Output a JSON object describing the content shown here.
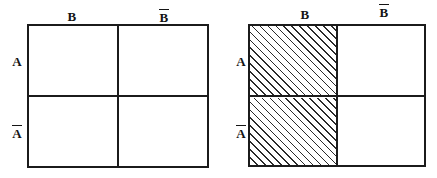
{
  "figure": {
    "background_color": "#ffffff",
    "line_color": "#1b1b1b",
    "hatch_color": "#2a2a2a"
  },
  "diagrams": [
    {
      "id": "left",
      "name": "diagram-a",
      "meaning": "A",
      "column_labels": [
        {
          "text": "B",
          "overbar": false
        },
        {
          "text": "B",
          "overbar": true
        }
      ],
      "row_labels": [
        {
          "text": "A",
          "overbar": false
        },
        {
          "text": "A",
          "overbar": true
        }
      ],
      "cells": [
        {
          "row": "A",
          "col": "B",
          "shaded": true
        },
        {
          "row": "A",
          "col": "Bbar",
          "shaded": true
        },
        {
          "row": "Abar",
          "col": "B",
          "shaded": false
        },
        {
          "row": "Abar",
          "col": "Bbar",
          "shaded": false
        }
      ],
      "shaded_region_description": "top row shaded (A)"
    },
    {
      "id": "right",
      "name": "diagram-b",
      "meaning": "B",
      "column_labels": [
        {
          "text": "B",
          "overbar": false
        },
        {
          "text": "B",
          "overbar": true
        }
      ],
      "row_labels": [
        {
          "text": "A",
          "overbar": false
        },
        {
          "text": "A",
          "overbar": true
        }
      ],
      "cells": [
        {
          "row": "A",
          "col": "B",
          "shaded": true
        },
        {
          "row": "A",
          "col": "Bbar",
          "shaded": false
        },
        {
          "row": "Abar",
          "col": "B",
          "shaded": true
        },
        {
          "row": "Abar",
          "col": "Bbar",
          "shaded": false
        }
      ],
      "shaded_region_description": "left column shaded (B)"
    }
  ],
  "labels": {
    "left": {
      "col1": "B",
      "col2": "B",
      "row1": "A",
      "row2": "A"
    },
    "right": {
      "col1": "B",
      "col2": "B",
      "row1": "A",
      "row2": "A"
    }
  }
}
